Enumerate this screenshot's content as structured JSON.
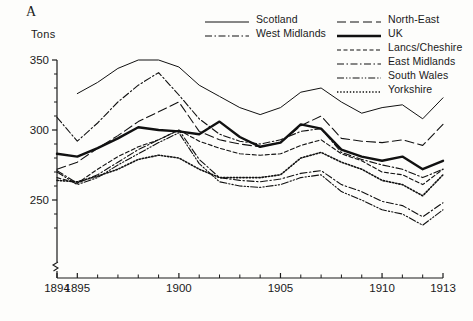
{
  "panel_label": "A",
  "y_axis_title": "Tons",
  "legend": {
    "columns": [
      {
        "items": [
          {
            "label": "Scotland",
            "key": "solid-thin"
          },
          {
            "label": "West Midlands",
            "key": "dash-dot"
          }
        ]
      },
      {
        "items": [
          {
            "label": "North-East",
            "key": "long-dash"
          },
          {
            "label": "UK",
            "key": "solid-thick"
          },
          {
            "label": "Lancs/Cheshire",
            "key": "short-dash"
          },
          {
            "label": "East Midlands",
            "key": "dash-dot"
          },
          {
            "label": "South Wales",
            "key": "dash-dot-dot"
          },
          {
            "label": "Yorkshire",
            "key": "dotted"
          }
        ]
      }
    ]
  },
  "chart_data": {
    "type": "line",
    "title": "",
    "xlabel": "",
    "ylabel": "Tons",
    "xlim": [
      1894,
      1913
    ],
    "ylim": [
      240,
      350
    ],
    "grid": false,
    "axis_break_y": true,
    "legend_position": "top-right",
    "x": [
      1894,
      1895,
      1896,
      1897,
      1898,
      1899,
      1900,
      1901,
      1902,
      1903,
      1904,
      1905,
      1906,
      1907,
      1908,
      1909,
      1910,
      1911,
      1912,
      1913
    ],
    "xticks": [
      1894,
      1895,
      1900,
      1905,
      1910,
      1913
    ],
    "yticks": [
      250,
      300,
      350
    ],
    "yticks_minor": [
      260,
      270,
      280,
      290,
      310,
      320,
      330,
      340
    ],
    "series": [
      {
        "name": "Scotland",
        "style": "solid-thin",
        "values": [
          null,
          326,
          334,
          344,
          350,
          350,
          345,
          332,
          324,
          316,
          311,
          316,
          327,
          330,
          320,
          312,
          316,
          318,
          308,
          323
        ]
      },
      {
        "name": "West Midlands",
        "style": "dash-dot",
        "values": [
          309,
          292,
          305,
          320,
          332,
          341,
          325,
          308,
          297,
          292,
          290,
          293,
          299,
          301,
          284,
          279,
          275,
          272,
          266,
          272
        ]
      },
      {
        "name": "North-East",
        "style": "long-dash",
        "values": [
          272,
          277,
          287,
          296,
          306,
          313,
          320,
          299,
          293,
          290,
          288,
          291,
          303,
          310,
          294,
          292,
          291,
          293,
          289,
          304
        ]
      },
      {
        "name": "UK",
        "style": "solid-thick",
        "values": [
          283,
          281,
          287,
          294,
          302,
          300,
          299,
          297,
          306,
          295,
          288,
          291,
          304,
          301,
          286,
          281,
          278,
          281,
          272,
          278
        ]
      },
      {
        "name": "Lancs/Cheshire",
        "style": "short-dash",
        "values": [
          266,
          262,
          272,
          281,
          288,
          293,
          300,
          292,
          287,
          283,
          282,
          283,
          289,
          293,
          283,
          278,
          270,
          268,
          261,
          272
        ]
      },
      {
        "name": "East Midlands",
        "style": "dash-dot",
        "values": [
          271,
          262,
          268,
          277,
          286,
          293,
          300,
          279,
          266,
          264,
          263,
          265,
          269,
          271,
          261,
          256,
          249,
          246,
          238,
          248
        ]
      },
      {
        "name": "South Wales",
        "style": "dash-dot-dot",
        "values": [
          270,
          261,
          266,
          275,
          283,
          291,
          298,
          276,
          263,
          260,
          259,
          261,
          266,
          268,
          256,
          250,
          243,
          240,
          232,
          243
        ]
      },
      {
        "name": "Yorkshire",
        "style": "dotted",
        "values": [
          264,
          263,
          267,
          272,
          279,
          282,
          280,
          272,
          266,
          266,
          266,
          268,
          280,
          284,
          277,
          272,
          264,
          261,
          253,
          268
        ]
      }
    ]
  }
}
